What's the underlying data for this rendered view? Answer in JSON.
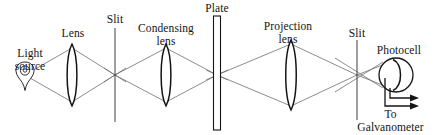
{
  "figure": {
    "type": "optical-bench-diagram",
    "title": "",
    "background": "#ffffff",
    "line_color": "#141414",
    "ray_color": "#6e6e6e",
    "width": 434,
    "height": 135,
    "optical_axis_y": 75
  },
  "labels": {
    "light_source": "Light\nsource",
    "lens": "Lens",
    "slit_1": "Slit",
    "condensing_lens": "Condensing\nlens",
    "plate": "Plate",
    "projection_lens": "Projection\nlens",
    "slit_2": "Slit",
    "photocell": "Photocell",
    "galvanometer": "To\nGalvanometer"
  },
  "components": [
    {
      "name": "light-source",
      "icon": "lamp-bulb-icon",
      "x": 25,
      "y": 75
    },
    {
      "name": "lens",
      "icon": "biconvex-lens-icon",
      "x": 72,
      "y": 75
    },
    {
      "name": "slit-1",
      "icon": "slit-line-icon",
      "x": 115,
      "y": 75
    },
    {
      "name": "condensing-lens",
      "icon": "biconvex-lens-icon",
      "x": 166,
      "y": 75
    },
    {
      "name": "plate",
      "icon": "plate-icon",
      "x": 217,
      "y": 75
    },
    {
      "name": "projection-lens",
      "icon": "biconvex-lens-icon",
      "x": 291,
      "y": 75
    },
    {
      "name": "slit-2",
      "icon": "slit-line-icon",
      "x": 357,
      "y": 75
    },
    {
      "name": "photocell",
      "icon": "photocell-icon",
      "x": 396,
      "y": 75
    }
  ],
  "output_leads": {
    "count": 2,
    "direction": "right",
    "arrow_glyph": "arrow-right-icon"
  }
}
